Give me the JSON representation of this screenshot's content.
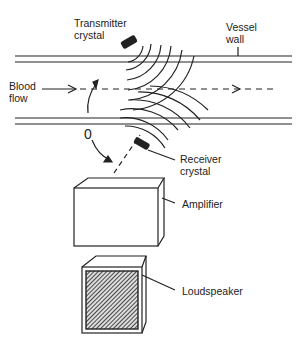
{
  "diagram": {
    "labels": {
      "transmitter": [
        "Transmitter",
        "crystal"
      ],
      "vessel_wall": [
        "Vessel",
        "wall"
      ],
      "blood_flow": [
        "Blood",
        "flow"
      ],
      "receiver": [
        "Receiver",
        "crystal"
      ],
      "amplifier": "Amplifier",
      "loudspeaker": "Loudspeaker",
      "angle": "0"
    },
    "colors": {
      "ink": "#222222",
      "background": "#ffffff"
    }
  }
}
